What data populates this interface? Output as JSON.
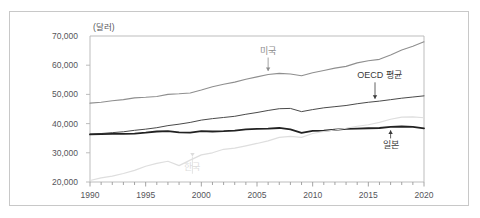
{
  "figure": {
    "unit_label": "(달러)",
    "border_color": "#c8c8c8",
    "background": "#ffffff"
  },
  "chart_data": {
    "type": "line",
    "title": "",
    "subtitle": "",
    "xlabel": "",
    "ylabel": "(달러)",
    "unit": "달러",
    "grid": false,
    "legend_position": "inline-annotations",
    "xlim": [
      1990,
      2020
    ],
    "ylim": [
      20000,
      70000
    ],
    "ytick_labels": [
      "70,000",
      "60,000",
      "50,000",
      "40,000",
      "30,000",
      "20,000"
    ],
    "ytick_values": [
      70000,
      60000,
      50000,
      40000,
      30000,
      20000
    ],
    "xtick_labels": [
      "1990",
      "1995",
      "2000",
      "2005",
      "2010",
      "2015",
      "2020"
    ],
    "xtick_values": [
      1990,
      1995,
      2000,
      2005,
      2010,
      2015,
      2020
    ],
    "xtick_minor_step": 1,
    "x": [
      1990,
      1991,
      1992,
      1993,
      1994,
      1995,
      1996,
      1997,
      1998,
      1999,
      2000,
      2001,
      2002,
      2003,
      2004,
      2005,
      2006,
      2007,
      2008,
      2009,
      2010,
      2011,
      2012,
      2013,
      2014,
      2015,
      2016,
      2017,
      2018,
      2019,
      2020
    ],
    "series": [
      {
        "name": "미국",
        "label": "미국",
        "color": "#8f8f8f",
        "width": 1.1,
        "values": [
          47000,
          47300,
          47800,
          48200,
          48800,
          49000,
          49300,
          50000,
          50200,
          50500,
          51500,
          52600,
          53500,
          54200,
          55200,
          56000,
          56800,
          57200,
          57000,
          56400,
          57400,
          58200,
          59000,
          59600,
          60800,
          61500,
          62000,
          63500,
          65200,
          66500,
          68000
        ]
      },
      {
        "name": "OECD 평균",
        "label": "OECD 평균",
        "color": "#4a4a4a",
        "width": 1.0,
        "values": [
          36400,
          36600,
          36900,
          37200,
          37700,
          38100,
          38600,
          39300,
          39800,
          40400,
          41200,
          41700,
          42100,
          42500,
          43200,
          43800,
          44500,
          45100,
          45200,
          44100,
          44800,
          45400,
          45800,
          46200,
          46800,
          47300,
          47700,
          48200,
          48700,
          49100,
          49500
        ]
      },
      {
        "name": "일본",
        "label": "일본",
        "color": "#222222",
        "width": 1.8,
        "values": [
          36300,
          36400,
          36500,
          36500,
          36600,
          36900,
          37300,
          37400,
          37000,
          36900,
          37400,
          37300,
          37400,
          37600,
          38000,
          38200,
          38300,
          38500,
          38000,
          36800,
          37500,
          37600,
          37900,
          38200,
          38300,
          38400,
          38500,
          38900,
          39000,
          38900,
          38400
        ]
      },
      {
        "name": "한국",
        "label": "한국",
        "color": "#dedede",
        "width": 1.2,
        "values": [
          20500,
          21400,
          22000,
          22900,
          24000,
          25400,
          26400,
          27100,
          25600,
          27500,
          29300,
          30000,
          31200,
          31600,
          32400,
          33200,
          34100,
          35300,
          35600,
          35300,
          36600,
          37300,
          37800,
          38400,
          39100,
          39600,
          40400,
          41500,
          42200,
          42300,
          42000
        ]
      }
    ],
    "annotations": [
      {
        "name": "미국",
        "text": "미국",
        "color": "#8c8c8c",
        "label_x": 2006.0,
        "label_y": 64000,
        "point_x": 2006.0,
        "point_y": 56800,
        "arrow": "down"
      },
      {
        "name": "OECD 평균",
        "text": "OECD 평균",
        "color": "#3a3a3a",
        "label_x": 2016.0,
        "label_y": 55500,
        "point_x": 2015.6,
        "point_y": 47300,
        "arrow": "down"
      },
      {
        "name": "일본",
        "text": "일본",
        "color": "#3a3a3a",
        "label_x": 2017.0,
        "label_y": 31500,
        "point_x": 2017.0,
        "point_y": 38900,
        "arrow": "up"
      },
      {
        "name": "한국",
        "text": "한국",
        "color": "#dcdcdc",
        "label_x": 1999.2,
        "label_y": 24200,
        "point_x": 1999.2,
        "point_y": 27500,
        "arrow": "down"
      }
    ]
  }
}
